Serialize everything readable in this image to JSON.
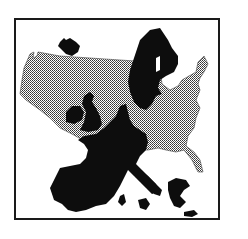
{
  "image": {
    "description": "Illustration: map of Europe (black silhouette) overlaid on map of the contiguous United States (halftone gray pattern), inside a square black frame",
    "elements": [
      "frame",
      "usa-map",
      "europe-map"
    ],
    "colors": {
      "frame": "#1a1a1a",
      "europe": "#0d0d0d",
      "usa_fill": "#9a9a9a",
      "background": "#ffffff"
    }
  }
}
